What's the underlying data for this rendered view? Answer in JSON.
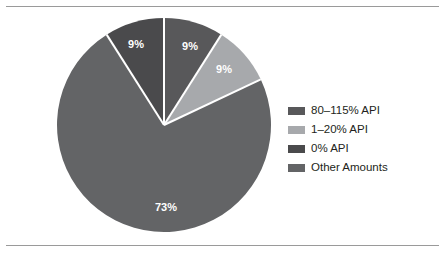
{
  "chart_data": {
    "type": "pie",
    "title": "",
    "subtitle": "",
    "xlabel": "",
    "ylabel": "",
    "grid": false,
    "legend_position": "right",
    "start_angle_deg": 0,
    "direction": "clockwise",
    "categories": [
      "80–115% API",
      "1–20% API",
      "Other Amounts",
      "0% API"
    ],
    "values": [
      9,
      9,
      73,
      9
    ],
    "slices": [
      {
        "label": "80–115% API",
        "value": 9,
        "data_label": "9%",
        "color": "#58585a",
        "start_deg": 0,
        "end_deg": 32.4,
        "label_x": 190,
        "label_y": 47
      },
      {
        "label": "1–20% API",
        "value": 9,
        "data_label": "9%",
        "color": "#a7a9ac",
        "start_deg": 32.4,
        "end_deg": 64.8,
        "label_x": 224,
        "label_y": 70
      },
      {
        "label": "Other Amounts",
        "value": 73,
        "data_label": "73%",
        "color": "#636466",
        "start_deg": 64.8,
        "end_deg": 327.6,
        "label_x": 166,
        "label_y": 208
      },
      {
        "label": "0% API",
        "value": 9,
        "data_label": "9%",
        "color": "#4a4a4c",
        "start_deg": 327.6,
        "end_deg": 360,
        "label_x": 136,
        "label_y": 45
      }
    ],
    "geometry": {
      "center_x": 164,
      "center_y": 125,
      "radius": 107,
      "separator_color": "#ffffff",
      "separator_width": 2
    },
    "legend": [
      {
        "label": "80–115% API",
        "color": "#58585a"
      },
      {
        "label": "1–20% API",
        "color": "#a7a9ac"
      },
      {
        "label": "0% API",
        "color": "#4a4a4c"
      },
      {
        "label": "Other Amounts",
        "color": "#636466"
      }
    ]
  },
  "figure": {
    "background": "#ffffff",
    "rule_color": "#9a9a9a"
  }
}
